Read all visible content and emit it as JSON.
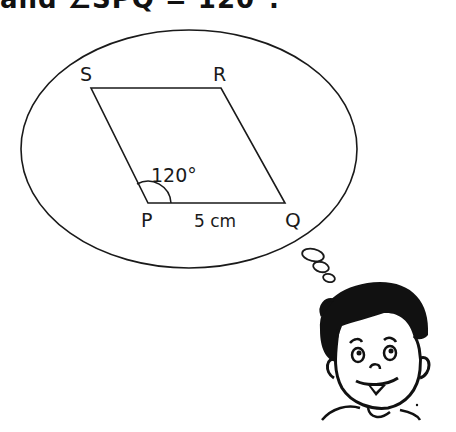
{
  "heading_fragment": "  and ∠SPQ = 120°.",
  "diagram": {
    "shape": "parallelogram",
    "vertices": {
      "S": {
        "label": "S"
      },
      "R": {
        "label": "R"
      },
      "P": {
        "label": "P"
      },
      "Q": {
        "label": "Q"
      }
    },
    "angle_label": "120°",
    "side_label": "5 cm",
    "stroke_color": "#1a1a1a",
    "background": "#ffffff"
  },
  "character": {
    "description": "cartoon boy thinking",
    "thought_bubble": "ellipse"
  }
}
